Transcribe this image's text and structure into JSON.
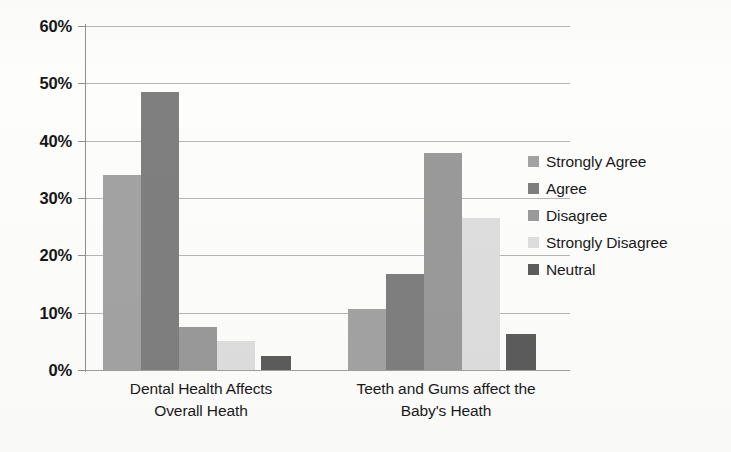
{
  "chart_data": {
    "type": "bar",
    "title": "",
    "subtitle": "",
    "xlabel": "",
    "ylabel": "",
    "categories": [
      "Dental Health Affects Overall Heath",
      "Teeth and Gums affect the Baby's Heath"
    ],
    "category_lines": [
      [
        "Dental Health Affects",
        "Overall Heath"
      ],
      [
        "Teeth and Gums affect the",
        "Baby's Heath"
      ]
    ],
    "series": [
      {
        "name": "Strongly Agree",
        "color": "#a3a3a3",
        "values": [
          34.0,
          10.7
        ]
      },
      {
        "name": "Agree",
        "color": "#7f7f7f",
        "values": [
          48.5,
          16.7
        ]
      },
      {
        "name": "Disagree",
        "color": "#9a9a9a",
        "values": [
          7.5,
          37.8
        ]
      },
      {
        "name": "Strongly Disagree",
        "color": "#dedede",
        "values": [
          5.0,
          26.5
        ]
      },
      {
        "name": "Neutral",
        "color": "#5c5c5c",
        "values": [
          2.5,
          6.2
        ]
      }
    ],
    "ylim": [
      0,
      60
    ],
    "ytick_values": [
      0,
      10,
      20,
      30,
      40,
      50,
      60
    ],
    "ytick_labels": [
      "0%",
      "10%",
      "20%",
      "30%",
      "40%",
      "50%",
      "60%"
    ],
    "grid": true,
    "legend_position": "right",
    "bar_gap_between_groups": true
  },
  "legend": {
    "items": [
      {
        "label": "Strongly Agree",
        "swatch": "#a3a3a3"
      },
      {
        "label": "Agree",
        "swatch": "#7f7f7f"
      },
      {
        "label": "Disagree",
        "swatch": "#9a9a9a"
      },
      {
        "label": "Strongly Disagree",
        "swatch": "#dedede"
      },
      {
        "label": "Neutral",
        "swatch": "#5c5c5c"
      }
    ]
  },
  "axis": {
    "y_labels": [
      "60%",
      "50%",
      "40%",
      "30%",
      "20%",
      "10%",
      "0%"
    ]
  }
}
